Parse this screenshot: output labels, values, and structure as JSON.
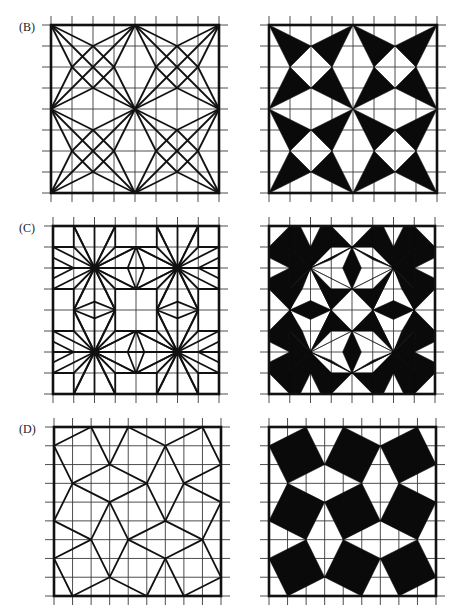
{
  "figure": {
    "rows": [
      {
        "label": "(B)",
        "grid_divisions": 8
      },
      {
        "label": "(C)",
        "grid_divisions": 8
      },
      {
        "label": "(D)",
        "grid_divisions": 9
      }
    ],
    "columns": [
      "line construction",
      "filled pattern"
    ]
  },
  "colors": {
    "ink": "#111111",
    "background": "#ffffff"
  }
}
